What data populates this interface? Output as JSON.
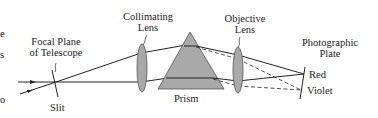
{
  "diagram": {
    "type": "optical-schematic",
    "labels": {
      "focal_plane_line1": "Focal Plane",
      "focal_plane_line2": "of Telescope",
      "slit": "Slit",
      "collimating_line1": "Collimating",
      "collimating_line2": "Lens",
      "objective_line1": "Objective",
      "objective_line2": "Lens",
      "prism": "Prism",
      "plate_line1": "Photographic",
      "plate_line2": "Plate",
      "red": "Red",
      "violet": "Violet"
    },
    "edge_fragments": [
      "e",
      "s",
      "o"
    ],
    "colors": {
      "element_fill": "#a9a9a9",
      "line": "#222222",
      "background": "#ffffff"
    },
    "legend_semantics": {
      "solid_ray": "Red light path",
      "dashed_ray": "Violet light path"
    }
  }
}
